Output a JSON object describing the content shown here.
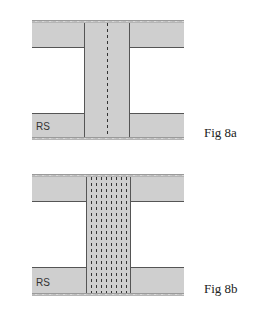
{
  "figures": [
    {
      "id": "8a",
      "caption": "Fig 8a",
      "label": "RS",
      "dashed_lines": 1
    },
    {
      "id": "8b",
      "caption": "Fig 8b",
      "label": "RS",
      "dashed_lines": 8
    }
  ],
  "colors": {
    "fill": "#cfcfcf",
    "outline": "#555555",
    "dash": "#333333",
    "background": "#ffffff"
  }
}
